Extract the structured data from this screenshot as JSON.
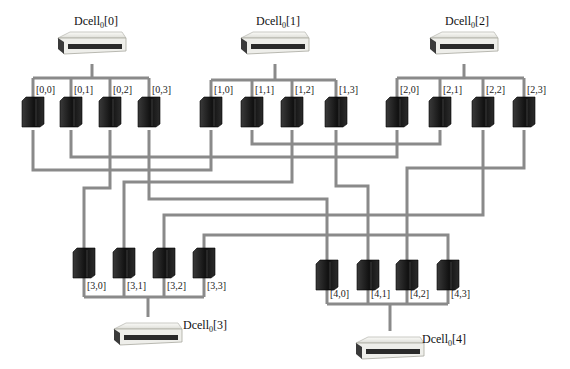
{
  "diagram": {
    "type": "DCell network topology",
    "colors": {
      "link": "#8a8a8a",
      "server": "#1a1a1a",
      "switch_body": "#eeeeea",
      "switch_front": "#2a2a2a",
      "text": "#222222"
    },
    "cells": [
      {
        "id": 0,
        "name": "Dcell",
        "sub": "0",
        "index": "[0]",
        "switch": {
          "x": 92,
          "y": 32
        },
        "label_pos": {
          "x": 74,
          "y": 14
        },
        "bus_y": 78,
        "orientation": "top",
        "servers": [
          {
            "label": "[0,0]",
            "x": 33
          },
          {
            "label": "[0,1]",
            "x": 71
          },
          {
            "label": "[0,2]",
            "x": 110
          },
          {
            "label": "[0,3]",
            "x": 149
          }
        ]
      },
      {
        "id": 1,
        "name": "Dcell",
        "sub": "0",
        "index": "[1]",
        "switch": {
          "x": 275,
          "y": 32
        },
        "label_pos": {
          "x": 256,
          "y": 14
        },
        "bus_y": 80,
        "orientation": "top",
        "servers": [
          {
            "label": "[1,0]",
            "x": 211
          },
          {
            "label": "[1,1]",
            "x": 252
          },
          {
            "label": "[1,2]",
            "x": 292
          },
          {
            "label": "[1,3]",
            "x": 336
          }
        ]
      },
      {
        "id": 2,
        "name": "Dcell",
        "sub": "0",
        "index": "[2]",
        "switch": {
          "x": 464,
          "y": 32
        },
        "label_pos": {
          "x": 445,
          "y": 14
        },
        "bus_y": 78,
        "orientation": "top",
        "servers": [
          {
            "label": "[2,0]",
            "x": 397
          },
          {
            "label": "[2,1]",
            "x": 440
          },
          {
            "label": "[2,2]",
            "x": 483
          },
          {
            "label": "[2,3]",
            "x": 524
          }
        ]
      },
      {
        "id": 3,
        "name": "Dcell",
        "sub": "0",
        "index": "[3]",
        "switch": {
          "x": 148,
          "y": 323
        },
        "label_pos": {
          "x": 183,
          "y": 318
        },
        "bus_y": 297,
        "orientation": "bottom",
        "servers": [
          {
            "label": "[3,0]",
            "x": 84
          },
          {
            "label": "[3,1]",
            "x": 124
          },
          {
            "label": "[3,2]",
            "x": 164
          },
          {
            "label": "[3,3]",
            "x": 204
          }
        ]
      },
      {
        "id": 4,
        "name": "Dcell",
        "sub": "0",
        "index": "[4]",
        "switch": {
          "x": 390,
          "y": 337
        },
        "label_pos": {
          "x": 422,
          "y": 332
        },
        "bus_y": 304,
        "orientation": "bottom",
        "servers": [
          {
            "label": "[4,0]",
            "x": 327
          },
          {
            "label": "[4,1]",
            "x": 368
          },
          {
            "label": "[4,2]",
            "x": 407
          },
          {
            "label": "[4,3]",
            "x": 448
          }
        ]
      }
    ],
    "links": [
      {
        "from": "[0,0]",
        "to": "[1,0]",
        "path": [
          [
            33,
            130
          ],
          [
            33,
            170
          ],
          [
            211,
            170
          ],
          [
            211,
            130
          ]
        ]
      },
      {
        "from": "[0,1]",
        "to": "[2,0]",
        "path": [
          [
            71,
            130
          ],
          [
            71,
            157
          ],
          [
            397,
            157
          ],
          [
            397,
            130
          ]
        ]
      },
      {
        "from": "[1,1]",
        "to": "[2,1]",
        "path": [
          [
            252,
            130
          ],
          [
            252,
            144
          ],
          [
            440,
            144
          ],
          [
            440,
            130
          ]
        ]
      },
      {
        "from": "[0,2]",
        "to": "[3,0]",
        "path": [
          [
            110,
            130
          ],
          [
            110,
            188
          ],
          [
            84,
            188
          ],
          [
            84,
            250
          ]
        ]
      },
      {
        "from": "[1,2]",
        "to": "[3,1]",
        "path": [
          [
            292,
            130
          ],
          [
            292,
            182
          ],
          [
            124,
            182
          ],
          [
            124,
            250
          ]
        ]
      },
      {
        "from": "[0,3]",
        "to": "[4,0]",
        "path": [
          [
            149,
            130
          ],
          [
            149,
            199
          ],
          [
            327,
            199
          ],
          [
            327,
            262
          ]
        ]
      },
      {
        "from": "[1,3]",
        "to": "[4,1]",
        "path": [
          [
            336,
            130
          ],
          [
            336,
            186
          ],
          [
            368,
            186
          ],
          [
            368,
            262
          ]
        ]
      },
      {
        "from": "[2,2]",
        "to": "[3,2]",
        "path": [
          [
            483,
            130
          ],
          [
            483,
            215
          ],
          [
            164,
            215
          ],
          [
            164,
            250
          ]
        ]
      },
      {
        "from": "[2,3]",
        "to": "[4,2]",
        "path": [
          [
            524,
            130
          ],
          [
            524,
            168
          ],
          [
            407,
            168
          ],
          [
            407,
            262
          ]
        ]
      },
      {
        "from": "[3,3]",
        "to": "[4,3]",
        "path": [
          [
            204,
            250
          ],
          [
            204,
            235
          ],
          [
            448,
            235
          ],
          [
            448,
            262
          ]
        ]
      }
    ]
  }
}
